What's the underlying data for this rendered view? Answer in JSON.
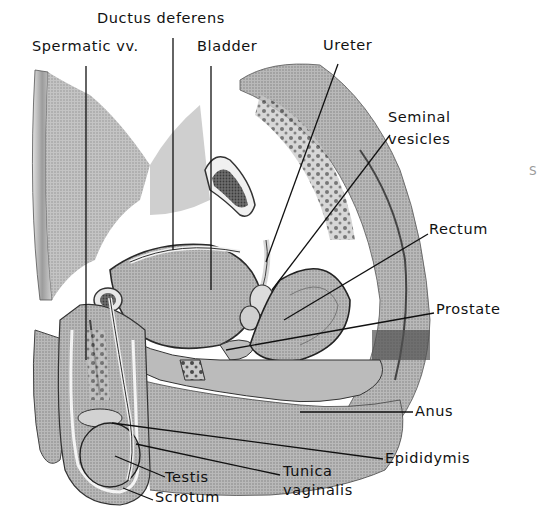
{
  "figure": {
    "style": "grayscale stippled anatomical illustration",
    "colors": {
      "background": "#ffffff",
      "text": "#111111",
      "leader": "#111111",
      "tissue_light": "#d6d6d6",
      "tissue_mid": "#a8a8a8",
      "tissue_dark": "#5a5a5a",
      "tissue_darkest": "#2a2a2a"
    }
  },
  "labels": [
    {
      "id": "ductus-deferens",
      "text": "Ductus deferens",
      "x": 97,
      "y": 18,
      "leader": [
        [
          173,
          38
        ],
        [
          173,
          250
        ]
      ]
    },
    {
      "id": "spermatic-vv",
      "text": "Spermatic vv.",
      "x": 32,
      "y": 46,
      "leader": [
        [
          86,
          66
        ],
        [
          86,
          360
        ]
      ]
    },
    {
      "id": "bladder",
      "text": "Bladder",
      "x": 197,
      "y": 46,
      "leader": [
        [
          211,
          66
        ],
        [
          211,
          290
        ]
      ]
    },
    {
      "id": "ureter",
      "text": "Ureter",
      "x": 323,
      "y": 45,
      "leader": [
        [
          338,
          64
        ],
        [
          266,
          262
        ]
      ]
    },
    {
      "id": "seminal-vesicles",
      "text": "Seminal\nvesicles",
      "x": 387,
      "y": 112,
      "leader": [
        [
          390,
          135
        ],
        [
          272,
          290
        ]
      ]
    },
    {
      "id": "rectum",
      "text": "Rectum",
      "x": 429,
      "y": 222,
      "leader": [
        [
          428,
          234
        ],
        [
          284,
          320
        ]
      ]
    },
    {
      "id": "prostate",
      "text": "Prostate",
      "x": 436,
      "y": 302,
      "leader": [
        [
          434,
          313
        ],
        [
          226,
          350
        ]
      ]
    },
    {
      "id": "anus",
      "text": "Anus",
      "x": 415,
      "y": 400,
      "leader": [
        [
          413,
          412
        ],
        [
          300,
          412
        ]
      ]
    },
    {
      "id": "epididymis",
      "text": "Epididymis",
      "x": 385,
      "y": 451,
      "leader": [
        [
          383,
          459
        ],
        [
          112,
          423
        ]
      ]
    },
    {
      "id": "tunica-vaginalis",
      "text": "Tunica\nvaginalis",
      "x": 283,
      "y": 464,
      "leader": [
        [
          280,
          475
        ],
        [
          136,
          444
        ]
      ]
    },
    {
      "id": "testis",
      "text": "Testis",
      "x": 165,
      "y": 466,
      "leader": [
        [
          165,
          477
        ],
        [
          115,
          456
        ]
      ]
    },
    {
      "id": "scrotum",
      "text": "Scrotum",
      "x": 155,
      "y": 489,
      "leader": [
        [
          153,
          500
        ],
        [
          123,
          488
        ]
      ]
    }
  ],
  "edge_text": "S"
}
